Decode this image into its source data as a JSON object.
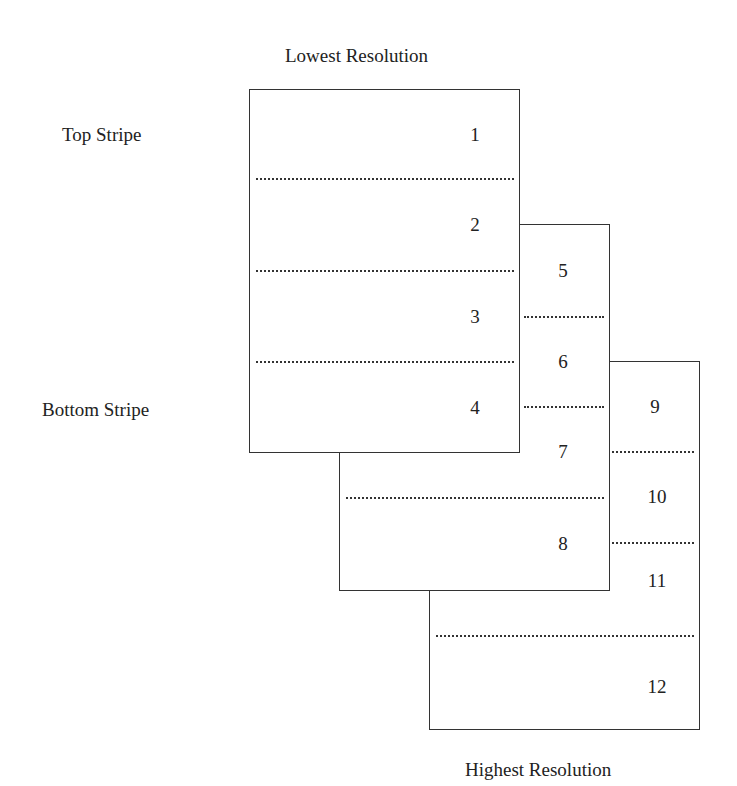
{
  "labels": {
    "top_title": "Lowest Resolution",
    "bottom_title": "Highest Resolution",
    "top_stripe": "Top Stripe",
    "bottom_stripe": "Bottom Stripe"
  },
  "layers": [
    {
      "name": "lowest-resolution",
      "stripes": [
        "1",
        "2",
        "3",
        "4"
      ]
    },
    {
      "name": "middle-resolution",
      "stripes": [
        "5",
        "6",
        "7",
        "8"
      ]
    },
    {
      "name": "highest-resolution",
      "stripes": [
        "9",
        "10",
        "11",
        "12"
      ]
    }
  ]
}
